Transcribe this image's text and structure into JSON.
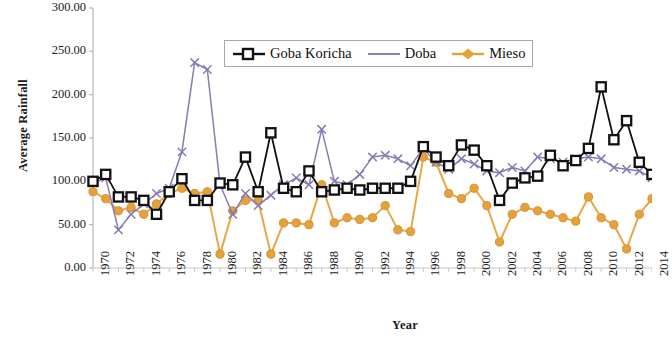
{
  "chart_data": {
    "type": "line",
    "title": "",
    "xlabel": "Year",
    "ylabel": "Average Rainfall",
    "ylim": [
      0,
      300
    ],
    "ytick_labels": [
      "0.00",
      "50.00",
      "100.00",
      "150.00",
      "200.00",
      "250.00",
      "300.00"
    ],
    "ytick_values": [
      0,
      50,
      100,
      150,
      200,
      250,
      300
    ],
    "xlim": [
      1970,
      2014
    ],
    "xtick_labels": [
      "1970",
      "1972",
      "1974",
      "1976",
      "1978",
      "1980",
      "1982",
      "1984",
      "1986",
      "1988",
      "1990",
      "1992",
      "1994",
      "1996",
      "1998",
      "2000",
      "2002",
      "2004",
      "2006",
      "2008",
      "2010",
      "2012",
      "2014"
    ],
    "x": [
      1970,
      1971,
      1972,
      1973,
      1974,
      1975,
      1976,
      1977,
      1978,
      1979,
      1980,
      1981,
      1982,
      1983,
      1984,
      1985,
      1986,
      1987,
      1988,
      1989,
      1990,
      1991,
      1992,
      1993,
      1994,
      1995,
      1996,
      1997,
      1998,
      1999,
      2000,
      2001,
      2002,
      2003,
      2004,
      2005,
      2006,
      2007,
      2008,
      2009,
      2010,
      2011,
      2012,
      2013,
      2014
    ],
    "grid": false,
    "legend_position": "top-center",
    "series": [
      {
        "name": "Goba Koricha",
        "color": "#111111",
        "marker": "square",
        "values": [
          100,
          108,
          82,
          82,
          78,
          62,
          88,
          103,
          78,
          78,
          98,
          96,
          128,
          88,
          156,
          92,
          88,
          112,
          88,
          90,
          92,
          90,
          92,
          92,
          92,
          100,
          140,
          128,
          118,
          142,
          136,
          118,
          78,
          98,
          104,
          106,
          130,
          118,
          124,
          138,
          209,
          148,
          170,
          122,
          108
        ]
      },
      {
        "name": "Doba",
        "color": "#8a7ab4",
        "marker": "x",
        "values": [
          98,
          104,
          44,
          62,
          74,
          86,
          92,
          134,
          237,
          229,
          96,
          62,
          86,
          72,
          84,
          96,
          104,
          96,
          160,
          100,
          96,
          108,
          128,
          130,
          126,
          118,
          138,
          122,
          114,
          126,
          120,
          112,
          110,
          116,
          112,
          128,
          126,
          122,
          126,
          128,
          126,
          116,
          114,
          112,
          104
        ]
      },
      {
        "name": "Mieso",
        "color": "#e5a23c",
        "marker": "circle",
        "values": [
          88,
          80,
          66,
          70,
          62,
          74,
          86,
          92,
          86,
          88,
          16,
          66,
          78,
          78,
          16,
          52,
          52,
          50,
          96,
          52,
          58,
          56,
          58,
          72,
          44,
          42,
          128,
          122,
          86,
          80,
          92,
          72,
          30,
          62,
          70,
          66,
          62,
          58,
          54,
          82,
          58,
          50,
          22,
          62,
          80
        ]
      }
    ]
  },
  "legend": {
    "items": [
      {
        "label": "Goba Koricha",
        "key": "square-marker-key",
        "color": "#111111"
      },
      {
        "label": "Doba",
        "key": "line-key",
        "color": "#8a7ab4"
      },
      {
        "label": "Mieso",
        "key": "circle-marker-key",
        "color": "#e5a23c"
      }
    ]
  },
  "axes": {
    "y_title": "Average Rainfall",
    "x_title": "Year"
  }
}
